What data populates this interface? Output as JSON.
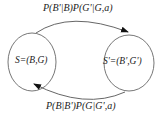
{
  "diagram": {
    "type": "state-transition",
    "nodes": [
      {
        "id": "S",
        "label": "S=(B,G)"
      },
      {
        "id": "S_prime",
        "label": "S'=(B',G')"
      }
    ],
    "edges": [
      {
        "from": "S",
        "to": "S_prime",
        "label": "P(B'|B)P(G'|G,a)"
      },
      {
        "from": "S_prime",
        "to": "S",
        "label": "P(B|B')P(G|G',a)"
      }
    ],
    "colors": {
      "stroke": "#555555",
      "text": "#222222",
      "background": "#ffffff"
    }
  }
}
